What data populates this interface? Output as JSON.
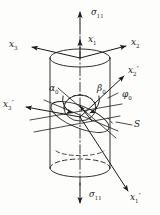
{
  "figure": {
    "type": "engineering-diagram",
    "background_color": "#fdfdfc",
    "line_color": "#1a1a1a"
  },
  "labels": {
    "stress_top": {
      "symbol": "σ",
      "sub": "11",
      "text": "σ11"
    },
    "stress_bottom": {
      "symbol": "σ",
      "sub": "11",
      "text": "σ11"
    },
    "axis_x1": {
      "base": "x",
      "sub": "1",
      "prime": "",
      "text": "x1"
    },
    "axis_x2": {
      "base": "x",
      "sub": "2",
      "prime": "",
      "text": "x2"
    },
    "axis_x3": {
      "base": "x",
      "sub": "3",
      "prime": "",
      "text": "x3"
    },
    "axis_x1p": {
      "base": "x",
      "sub": "1",
      "prime": "′",
      "text": "x1′"
    },
    "axis_x2p": {
      "base": "x",
      "sub": "2",
      "prime": "′",
      "text": "x2′"
    },
    "axis_x3p": {
      "base": "x",
      "sub": "3",
      "prime": "′",
      "text": "x3′"
    },
    "angle_alpha0": {
      "base": "α",
      "sub": "0",
      "text": "α0"
    },
    "angle_beta0": {
      "base": "β",
      "sub": "0",
      "text": "β0"
    },
    "angle_phi0": {
      "base": "φ",
      "sub": "0",
      "text": "φ0"
    },
    "section_S": {
      "base": "S",
      "text": "S"
    }
  },
  "geometry": {
    "cylinder": {
      "center_x": 80,
      "top_ellipse_cy": 58,
      "bottom_ellipse_cy": 168,
      "rx": 30,
      "ry": 9
    },
    "section_plane": {
      "label": "S",
      "tilt": "inclined cut through cylinder axis region"
    },
    "origin": {
      "x": 80,
      "y": 117
    }
  }
}
